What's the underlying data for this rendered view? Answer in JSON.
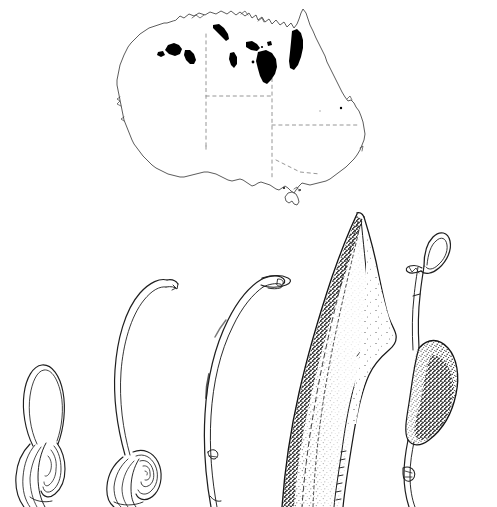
{
  "figure": {
    "kind": "scientific-botanical-plate",
    "background_color": "#ffffff",
    "ink_color": "#1a1a1a",
    "fill_color": "#000000",
    "caption": "",
    "panels": [
      {
        "id": "distribution-map",
        "label": "",
        "subject": "Australia distribution map"
      },
      {
        "id": "specimen-series",
        "label": "",
        "subject": "Inflorescence developmental series"
      }
    ]
  },
  "map": {
    "name": "australia-distribution-map",
    "outline_color": "#3a3a3a",
    "border_style": "dashed",
    "border_color": "#8a8a8a",
    "shading_color": "#000000",
    "bounds": {
      "x": 108,
      "y": 8,
      "width": 262,
      "height": 200
    },
    "landmasses": [
      {
        "name": "mainland-australia"
      },
      {
        "name": "tasmania"
      }
    ],
    "state_borders": [
      {
        "name": "wa-nt-sa-border"
      },
      {
        "name": "nt-sa-qld-border"
      },
      {
        "name": "sa-nsw-vic-border"
      },
      {
        "name": "qld-nsw-border"
      }
    ],
    "distribution_patches": [
      {
        "name": "kimberley-coast-patch",
        "region": "Kimberley, WA"
      },
      {
        "name": "kimberley-inland-patch",
        "region": "Kimberley, WA"
      },
      {
        "name": "darwin-coast-patch",
        "region": "Top End, NT"
      },
      {
        "name": "arnhem-west-patch",
        "region": "Arnhem Land, NT"
      },
      {
        "name": "arnhem-central-patch",
        "region": "Arnhem Land, NT"
      },
      {
        "name": "gulf-carpentaria-patch",
        "region": "Gulf of Carpentaria"
      },
      {
        "name": "cape-york-patch",
        "region": "Cape York Peninsula, QLD"
      },
      {
        "name": "ne-queensland-patch",
        "region": "NE Queensland"
      }
    ]
  },
  "specimens": {
    "name": "inflorescence-series",
    "count": 5,
    "items": [
      {
        "id": "specimen-1",
        "label": "",
        "stage": "bud, spathe tightly looped",
        "features": [
          "looped-spathe-limb",
          "coiled-base",
          "sheathing-bracts"
        ],
        "shaded": false
      },
      {
        "id": "specimen-2",
        "label": "",
        "stage": "elongating, arching spathe",
        "features": [
          "arching-limb",
          "clubbed-tip",
          "coiled-base",
          "sheathing-bracts"
        ],
        "shaded": false
      },
      {
        "id": "specimen-3",
        "label": "",
        "stage": "tall arched spathe with hooked apex",
        "features": [
          "tall-arch",
          "hooked-apex",
          "slender-stalk",
          "basal-node"
        ],
        "shaded": false
      },
      {
        "id": "specimen-4",
        "label": "",
        "stage": "expanded spathe blade",
        "features": [
          "broad-blade",
          "acuminate-apex",
          "stippled-shading",
          "midrib"
        ],
        "shaded": true
      },
      {
        "id": "specimen-5",
        "label": "",
        "stage": "spadix with swollen fertile zone",
        "features": [
          "looped-apex",
          "swollen-speckled-zone",
          "slender-stipe",
          "basal-sheath"
        ],
        "shaded": true
      }
    ]
  }
}
